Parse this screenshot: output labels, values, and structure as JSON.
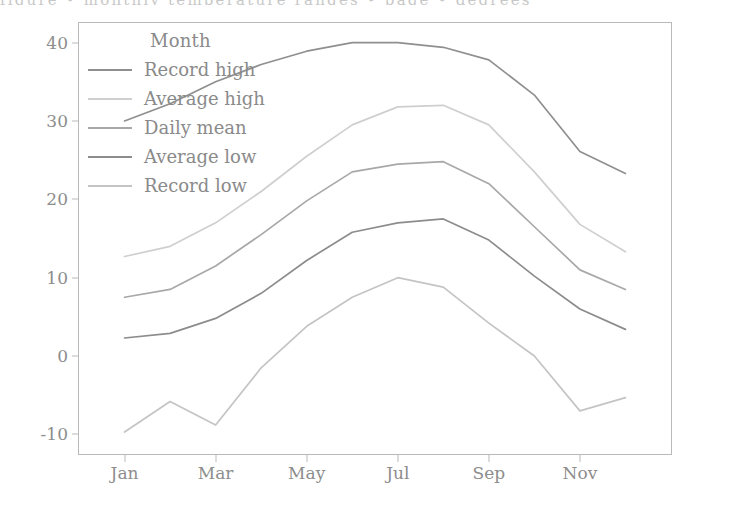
{
  "page": {
    "bleed_text": "figure  •  monthly  temperature  ranges  •  page  •  degrees"
  },
  "chart_data": {
    "type": "line",
    "title": "",
    "xlabel": "",
    "ylabel": "",
    "legend_title": "Month",
    "legend_position": "upper left",
    "grid": false,
    "xlim": [
      0,
      13
    ],
    "ylim": [
      -12.5,
      42.5
    ],
    "x": [
      1,
      2,
      3,
      4,
      5,
      6,
      7,
      8,
      9,
      10,
      11,
      12
    ],
    "categories": [
      "Jan",
      "Feb",
      "Mar",
      "Apr",
      "May",
      "Jun",
      "Jul",
      "Aug",
      "Sep",
      "Oct",
      "Nov",
      "Dec"
    ],
    "xticks": [
      1,
      3,
      5,
      7,
      9,
      11
    ],
    "xticklabels": [
      "Jan",
      "Mar",
      "May",
      "Jul",
      "Sep",
      "Nov"
    ],
    "yticks": [
      -10,
      0,
      10,
      20,
      30,
      40
    ],
    "yticklabels": [
      "-10",
      "0",
      "10",
      "20",
      "30",
      "40"
    ],
    "series": [
      {
        "name": "Record high",
        "color": "#8f8f8f",
        "values": [
          30.0,
          32.2,
          35.0,
          37.2,
          38.9,
          40.0,
          40.0,
          39.4,
          37.8,
          33.3,
          26.1,
          23.3
        ]
      },
      {
        "name": "Average high",
        "color": "#cfcfcf",
        "values": [
          12.7,
          14.0,
          17.0,
          21.0,
          25.5,
          29.5,
          31.8,
          32.0,
          29.5,
          23.5,
          16.8,
          13.3
        ]
      },
      {
        "name": "Daily mean",
        "color": "#a8a8a8",
        "values": [
          7.5,
          8.5,
          11.5,
          15.5,
          19.8,
          23.5,
          24.5,
          24.8,
          22.0,
          16.5,
          11.0,
          8.5
        ]
      },
      {
        "name": "Average low",
        "color": "#8c8c8c",
        "values": [
          2.3,
          2.9,
          4.8,
          8.0,
          12.2,
          15.8,
          17.0,
          17.5,
          14.8,
          10.2,
          6.0,
          3.4
        ]
      },
      {
        "name": "Record low",
        "color": "#c4c4c4",
        "values": [
          -9.7,
          -5.8,
          -8.8,
          -1.5,
          3.8,
          7.5,
          10.0,
          8.8,
          4.2,
          0.0,
          -7.0,
          -5.3
        ]
      }
    ]
  }
}
